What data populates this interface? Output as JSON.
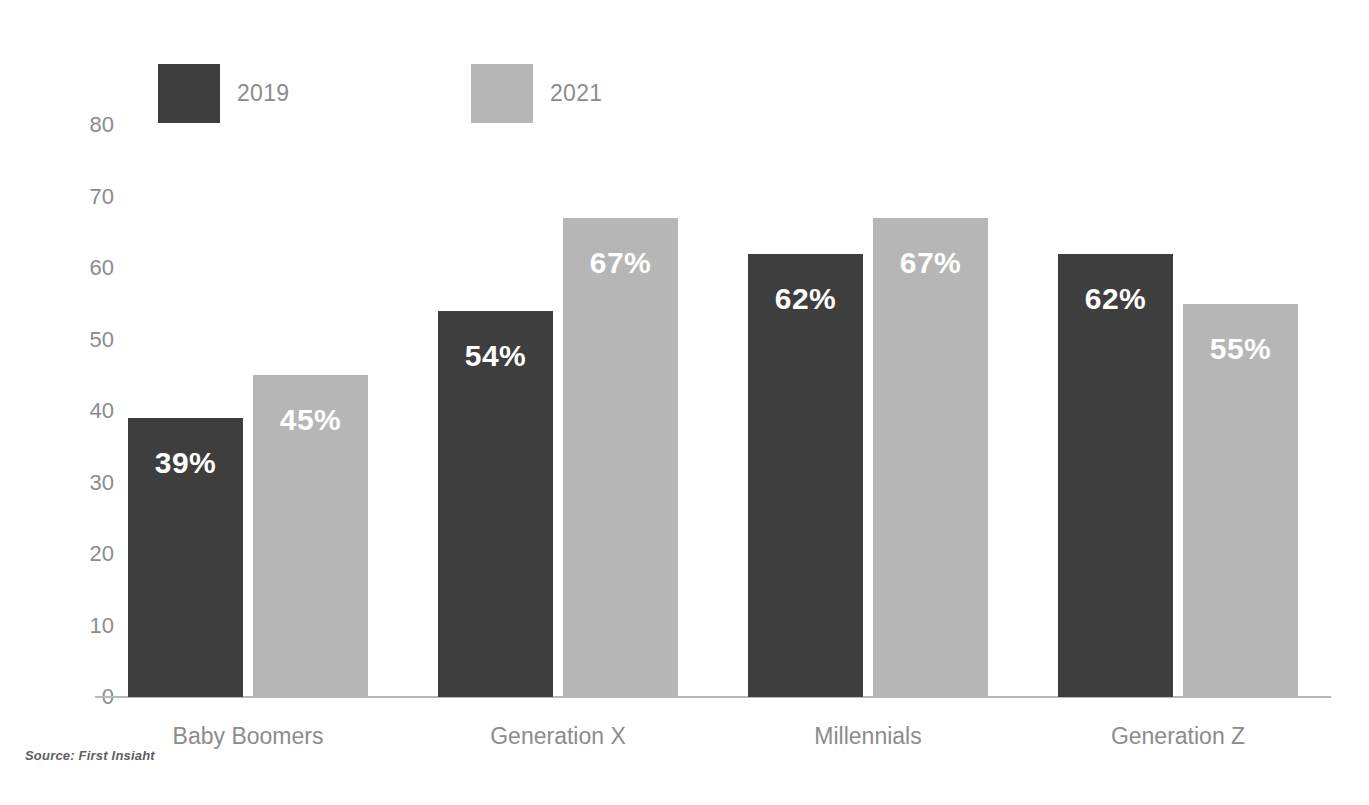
{
  "chart_data": {
    "type": "bar",
    "title": "",
    "subtitle": "",
    "xlabel": "",
    "ylabel": "",
    "categories": [
      "Baby Boomers",
      "Generation X",
      "Millennials",
      "Generation Z"
    ],
    "series": [
      {
        "name": "2019",
        "color": "#3e3e3e",
        "values": [
          39,
          54,
          62,
          62
        ],
        "labels": [
          "39%",
          "54%",
          "62%",
          "62%"
        ]
      },
      {
        "name": "2021",
        "color": "#b6b6b6",
        "values": [
          45,
          67,
          67,
          55
        ],
        "labels": [
          "45%",
          "67%",
          "67%",
          "55%"
        ]
      }
    ],
    "ylim": [
      0,
      80
    ],
    "y_ticks": [
      80,
      70,
      60,
      50,
      40,
      30,
      20,
      10,
      0
    ],
    "y_tick_labels": [
      "80",
      "70",
      "60",
      "50",
      "40",
      "30",
      "20",
      "10",
      "0"
    ],
    "grid": false,
    "legend_position": "top-left",
    "value_label_format": "percent",
    "value_label_color": "#ffffff",
    "axis_line_color": "#b8b8b8",
    "tick_label_color": "#8c8c8c"
  },
  "legend": {
    "items": [
      {
        "label": "2019",
        "color": "#3e3e3e"
      },
      {
        "label": "2021",
        "color": "#b6b6b6"
      }
    ]
  },
  "source": {
    "text": "Source: First Insiaht"
  }
}
